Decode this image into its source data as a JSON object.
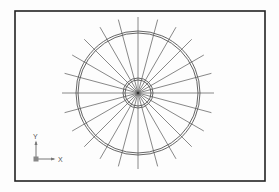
{
  "drawing": {
    "frame": {
      "x": 15,
      "y": 11,
      "width": 250,
      "height": 170,
      "stroke": "#222222"
    },
    "center": {
      "x": 138,
      "y": 93
    },
    "circles": [
      {
        "name": "outer-circle-a",
        "r": 62
      },
      {
        "name": "outer-circle-b",
        "r": 60
      },
      {
        "name": "inner-circle-a",
        "r": 15
      },
      {
        "name": "inner-circle-b",
        "r": 13
      }
    ],
    "radial_lines": {
      "count": 24,
      "angle_step_deg": 15,
      "length": 76
    },
    "line_color": "#6a6a6a",
    "circle_color": "#555555"
  },
  "ucs_icon": {
    "x_label": "X",
    "y_label": "Y"
  }
}
